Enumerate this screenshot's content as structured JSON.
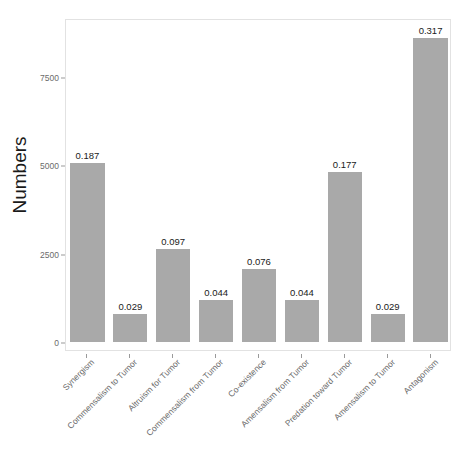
{
  "chart_data": {
    "type": "bar",
    "title": "",
    "xlabel": "",
    "ylabel": "Numbers",
    "ylim": [
      0,
      9000
    ],
    "yticks": [
      0,
      2500,
      5000,
      7500
    ],
    "ytick_labels": [
      "0",
      "2500",
      "5000",
      "7500"
    ],
    "grid": false,
    "legend": "none",
    "bar_color": "#a9a9a9",
    "panel_border_color": "#e2e2e2",
    "background_color": "#ffffff",
    "categories": [
      "Synergism",
      "Commensalism to Tumor",
      "Altruism for Tumor",
      "Commensalism from Tumor",
      "Co-existence",
      "Amensalism from Tumor",
      "Predation toward Tumor",
      "Amensalism to Tumor",
      "Antagonism"
    ],
    "values": [
      5080,
      790,
      2640,
      1195,
      2065,
      1195,
      4810,
      790,
      8610
    ],
    "data_labels": [
      "0.187",
      "0.029",
      "0.097",
      "0.044",
      "0.076",
      "0.044",
      "0.177",
      "0.029",
      "0.317"
    ],
    "bars": [
      {
        "category": "Synergism",
        "value": 5080,
        "label": "0.187"
      },
      {
        "category": "Commensalism to Tumor",
        "value": 790,
        "label": "0.029"
      },
      {
        "category": "Altruism for Tumor",
        "value": 2640,
        "label": "0.097"
      },
      {
        "category": "Commensalism from Tumor",
        "value": 1195,
        "label": "0.044"
      },
      {
        "category": "Co-existence",
        "value": 2065,
        "label": "0.076"
      },
      {
        "category": "Amensalism from Tumor",
        "value": 1195,
        "label": "0.044"
      },
      {
        "category": "Predation toward Tumor",
        "value": 4810,
        "label": "0.177"
      },
      {
        "category": "Amensalism to Tumor",
        "value": 790,
        "label": "0.029"
      },
      {
        "category": "Antagonism",
        "value": 8610,
        "label": "0.317"
      }
    ]
  }
}
